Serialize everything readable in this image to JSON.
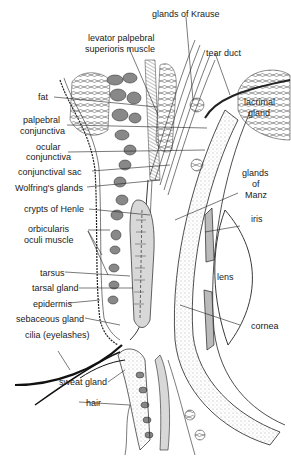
{
  "figure": {
    "labels": {
      "glands_of_krause": "glands of Krause",
      "levator_1": "levator palpebral",
      "levator_2": "superioris muscle",
      "tear_duct": "tear duct",
      "fat": "fat",
      "lacrimal_1": "lacrimal",
      "lacrimal_2": "gland",
      "palpebral_1": "palpebral",
      "palpebral_2": "conjunctiva",
      "ocular_1": "ocular",
      "ocular_2": "conjunctiva",
      "conjunctival_sac": "conjunctival sac",
      "wolfring": "Wolfring's glands",
      "manz_1": "glands",
      "manz_2": "of",
      "manz_3": "Manz",
      "henle": "crypts of Henle",
      "iris": "iris",
      "orbicularis_1": "orbicularis",
      "orbicularis_2": "oculi muscle",
      "lens": "lens",
      "tarsus": "tarsus",
      "tarsal_gland": "tarsal gland",
      "epidermis": "epidermis",
      "cornea": "cornea",
      "sebaceous": "sebaceous gland",
      "cilia": "cilia (eyelashes)",
      "sweat_gland": "sweat gland",
      "hair": "hair"
    }
  }
}
